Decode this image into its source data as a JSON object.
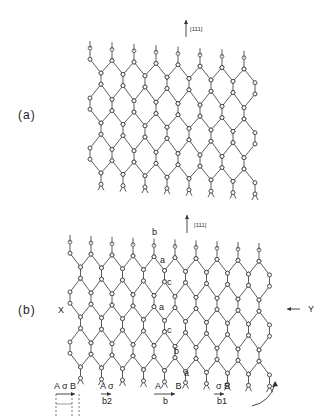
{
  "figure": {
    "panel_a": {
      "label": "(a)",
      "direction_label": "[111]",
      "lattice": {
        "x0": 90,
        "y0": 48,
        "cols": 8,
        "rows": 6,
        "dx": 22,
        "dy": 25,
        "shear": -0.18
      }
    },
    "panel_b": {
      "label": "(b)",
      "direction_label": "[111]",
      "left_marker": "X",
      "right_marker": "Y",
      "lattice": {
        "x0": 70,
        "y0": 242,
        "cols": 10,
        "rows": 6,
        "dx": 21,
        "dy": 25,
        "shear": -0.12
      },
      "stacking_labels": [
        {
          "text": "b",
          "x": 152,
          "y": 233
        },
        {
          "text": "a",
          "x": 160,
          "y": 261
        },
        {
          "text": "c",
          "x": 167,
          "y": 283
        },
        {
          "text": "a",
          "x": 159,
          "y": 308
        },
        {
          "text": "c",
          "x": 167,
          "y": 331
        },
        {
          "text": "b",
          "x": 174,
          "y": 352
        },
        {
          "text": "a",
          "x": 184,
          "y": 374
        }
      ],
      "burgers_vectors": [
        {
          "top": "A  σ B",
          "bottom": "",
          "x": 54
        },
        {
          "top": "A σ",
          "bottom": "b2",
          "x": 99
        },
        {
          "top": "A      B",
          "bottom": "b",
          "x": 155
        },
        {
          "top": "σ B",
          "bottom": "b1",
          "x": 216
        }
      ]
    }
  }
}
